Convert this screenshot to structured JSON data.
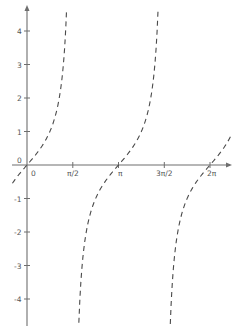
{
  "chart_data": {
    "type": "line",
    "title": "",
    "xlabel": "",
    "ylabel": "",
    "function": "y = tan(x)",
    "x_ticks": [
      "0",
      "π/2",
      "π",
      "3π/2",
      "2π"
    ],
    "x_tick_values": [
      0,
      1.5708,
      3.1416,
      4.7124,
      6.2832
    ],
    "y_ticks": [
      "-4",
      "-3",
      "-2",
      "-1",
      "0",
      "1",
      "2",
      "3",
      "4"
    ],
    "y_tick_values": [
      -4,
      -3,
      -2,
      -1,
      0,
      1,
      2,
      3,
      4
    ],
    "origin_label": "0",
    "xlim": [
      -0.5,
      7.0
    ],
    "ylim": [
      -4.8,
      4.7
    ],
    "grid": false,
    "legend": null,
    "line_style": "dashed",
    "series": [
      {
        "name": "tan(x) branch 1",
        "x": [
          -0.5,
          -0.25,
          0,
          0.25,
          0.5,
          0.75,
          1.0,
          1.2,
          1.3,
          1.36
        ],
        "y": [
          -0.55,
          -0.26,
          0,
          0.26,
          0.55,
          0.93,
          1.56,
          2.57,
          3.6,
          4.65
        ]
      },
      {
        "name": "tan(x) branch 2",
        "x": [
          1.78,
          1.84,
          1.94,
          2.14,
          2.39,
          2.64,
          2.89,
          3.14,
          3.39,
          3.64,
          3.89,
          4.14,
          4.34,
          4.44,
          4.5
        ],
        "y": [
          -4.7,
          -3.6,
          -2.57,
          -1.56,
          -0.93,
          -0.55,
          -0.26,
          0,
          0.26,
          0.55,
          0.93,
          1.56,
          2.57,
          3.6,
          4.65
        ]
      },
      {
        "name": "tan(x) branch 3",
        "x": [
          4.92,
          4.98,
          5.08,
          5.28,
          5.53,
          5.78,
          6.03,
          6.28,
          6.53,
          6.78,
          7.0
        ],
        "y": [
          -4.7,
          -3.6,
          -2.57,
          -1.56,
          -0.93,
          -0.55,
          -0.26,
          0,
          0.26,
          0.55,
          0.87
        ]
      }
    ]
  },
  "labels": {
    "origin": "0",
    "x0": "0",
    "x1": "π/2",
    "x2": "π",
    "x3": "3π/2",
    "x4": "2π",
    "y4": "4",
    "y3": "3",
    "y2": "2",
    "y1": "1",
    "ym1": "-1",
    "ym2": "-2",
    "ym3": "-3",
    "ym4": "-4"
  }
}
